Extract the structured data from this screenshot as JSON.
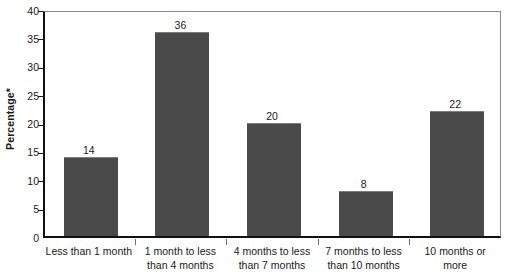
{
  "chart_data": {
    "type": "bar",
    "title": "",
    "xlabel": "",
    "ylabel": "Percentage*",
    "ylim": [
      0,
      40
    ],
    "ytick_step": 5,
    "yticks": [
      0,
      5,
      10,
      15,
      20,
      25,
      30,
      35,
      40
    ],
    "grid": false,
    "legend": false,
    "bar_color": "#4a4a4a",
    "categories": [
      "Less than 1 month",
      "1 month to less than 4 months",
      "4 months to less than 7 months",
      "7 months to less than 10 months",
      "10 months or more"
    ],
    "category_lines": [
      [
        "Less than 1 month",
        ""
      ],
      [
        "1 month to less",
        "than 4 months"
      ],
      [
        "4 months to less",
        "than 7 months"
      ],
      [
        "7 months to less",
        "than 10 months"
      ],
      [
        "10 months or",
        "more"
      ]
    ],
    "values": [
      14,
      36,
      20,
      8,
      22
    ],
    "value_labels": [
      "14",
      "36",
      "20",
      "8",
      "22"
    ]
  }
}
